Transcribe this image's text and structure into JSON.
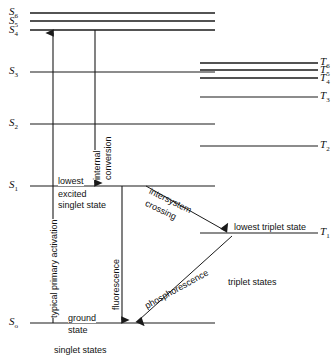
{
  "diagram": {
    "singlet_levels": [
      {
        "id": "S6",
        "label": "S",
        "sub": "6"
      },
      {
        "id": "S5",
        "label": "S",
        "sub": "5"
      },
      {
        "id": "S4",
        "label": "S",
        "sub": "4"
      },
      {
        "id": "S3",
        "label": "S",
        "sub": "3"
      },
      {
        "id": "S2",
        "label": "S",
        "sub": "2"
      },
      {
        "id": "S1",
        "label": "S",
        "sub": "1"
      },
      {
        "id": "S0",
        "label": "S",
        "sub": "o"
      }
    ],
    "triplet_levels": [
      {
        "id": "T6",
        "label": "T",
        "sub": "6"
      },
      {
        "id": "T5",
        "label": "T",
        "sub": "5"
      },
      {
        "id": "T4",
        "label": "T",
        "sub": "4"
      },
      {
        "id": "T3",
        "label": "T",
        "sub": "3"
      },
      {
        "id": "T2",
        "label": "T",
        "sub": "2"
      },
      {
        "id": "T1",
        "label": "T",
        "sub": "1"
      }
    ],
    "annotations": {
      "activation": "typical primary activation",
      "internal_line1": "internal",
      "internal_line2": "conversion",
      "fluorescence": "fluorescence",
      "lowest": "lowest",
      "excited": "excited",
      "singlet_state": "singlet state",
      "intersystem_line1": "intersystem",
      "intersystem_line2": "crossing",
      "lowest_triplet_state": "lowest triplet state",
      "phosphorescence": "phosphorescence",
      "triplet_states": "triplet states",
      "ground": "ground",
      "state": "state",
      "singlet_states": "singlet states"
    },
    "colors": {
      "line": "#1a1a1a",
      "text": "#111111",
      "background": "#ffffff"
    }
  }
}
